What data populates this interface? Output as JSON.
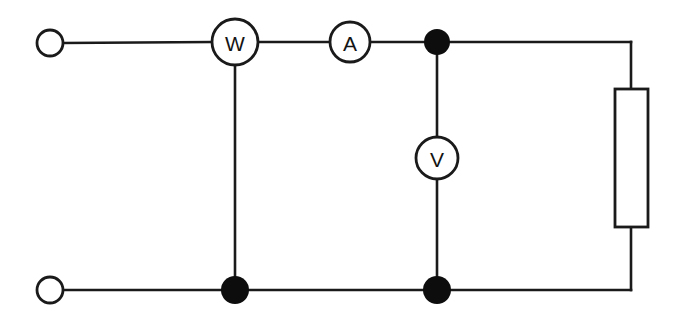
{
  "diagram": {
    "kind": "electrical-circuit-schematic",
    "background_color": "#ffffff",
    "line_color": "#1a1a1a",
    "junction_color": "#0d0d0d",
    "canvas": {
      "width": 676,
      "height": 321
    }
  },
  "meters": {
    "wattmeter": {
      "label": "W",
      "name": "wattmeter",
      "cx": 235,
      "cy": 42,
      "r": 23
    },
    "ammeter": {
      "label": "A",
      "name": "ammeter",
      "cx": 350,
      "cy": 42,
      "r": 20
    },
    "voltmeter": {
      "label": "V",
      "name": "voltmeter",
      "cx": 437,
      "cy": 158,
      "r": 21
    }
  },
  "terminals": [
    {
      "name": "supply-terminal-top",
      "cx": 50,
      "cy": 43,
      "r": 13
    },
    {
      "name": "supply-terminal-bottom",
      "cx": 50,
      "cy": 290,
      "r": 13
    }
  ],
  "junctions": [
    {
      "name": "junction-top-right",
      "cx": 437,
      "cy": 42,
      "r": 13
    },
    {
      "name": "junction-bottom-left",
      "cx": 235,
      "cy": 290,
      "r": 14
    },
    {
      "name": "junction-bottom-right",
      "cx": 437,
      "cy": 290,
      "r": 14
    }
  ],
  "load": {
    "name": "resistor-load",
    "shape": "rectangle",
    "x": 615,
    "y": 89,
    "width": 33,
    "height": 138
  },
  "wires": {
    "top_rail_left": "M63,43 L212,42",
    "top_rail_w_to_a": "M258,42 L330,42",
    "top_rail_a_to_junction": "M370,42 L437,42",
    "top_rail_junction_to_corner": "M437,42 L631,42",
    "right_rail_top": "M631,42 L631,89",
    "right_rail_bottom": "M631,227 L631,290",
    "bottom_rail_left": "M63,290 L235,290",
    "bottom_rail_mid": "M235,290 L437,290",
    "bottom_rail_right": "M437,290 L631,290",
    "wattmeter_drop": "M235,65 L235,290",
    "voltmeter_upper": "M437,55 L437,137",
    "voltmeter_lower": "M437,179 L437,290"
  }
}
